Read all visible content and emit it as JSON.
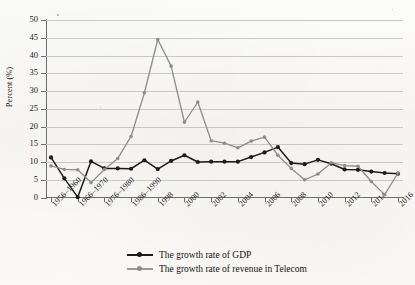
{
  "chart_data": {
    "type": "line",
    "title": "",
    "subtitle": "",
    "xlabel": "",
    "ylabel": "Percent (%)",
    "ylim": [
      0,
      50
    ],
    "ytick_step": 5,
    "yticks": [
      0,
      5,
      10,
      15,
      20,
      25,
      30,
      35,
      40,
      45,
      50
    ],
    "grid": true,
    "grid_axis": "y",
    "legend_position": "bottom-center",
    "x": [
      "1956–1960",
      "1961–1965",
      "1966–1970",
      "1971–1975",
      "1976–1980",
      "1981–1985",
      "1986–1990",
      "1991–1995",
      "1998",
      "1999",
      "2000",
      "2001",
      "2002",
      "2003",
      "2004",
      "2005",
      "2006",
      "2007",
      "2008",
      "2009",
      "2010",
      "2011",
      "2012",
      "2013",
      "2014",
      "2015",
      "2016"
    ],
    "xtick_labels": [
      "1956–1960",
      "1966–1970",
      "1976–1980",
      "1986–1990",
      "1998",
      "2000",
      "2002",
      "2004",
      "2006",
      "2008",
      "2010",
      "2012",
      "2014",
      "2016"
    ],
    "series": [
      {
        "name": "The growth rate of GDP",
        "color": "#1c1c1c",
        "marker": "circle",
        "values": [
          11.3,
          5.4,
          0.1,
          10.2,
          8.2,
          8.2,
          8.1,
          10.5,
          8.0,
          10.3,
          11.9,
          10.0,
          10.1,
          10.1,
          10.1,
          11.4,
          12.7,
          14.2,
          9.7,
          9.4,
          10.6,
          9.5,
          7.9,
          7.8,
          7.3,
          6.9,
          6.7
        ]
      },
      {
        "name": "The growth rate of revenue in Telecom",
        "color": "#8e8e8e",
        "marker": "circle",
        "values": [
          8.9,
          7.9,
          7.8,
          4.2,
          7.9,
          11.0,
          17.2,
          29.5,
          44.5,
          37.0,
          21.2,
          26.9,
          16.0,
          15.3,
          14.0,
          15.9,
          17.0,
          11.9,
          8.2,
          5.0,
          6.6,
          9.8,
          9.0,
          8.8,
          4.5,
          0.8,
          6.9
        ]
      }
    ]
  },
  "legend": {
    "items": [
      {
        "label": "The growth rate of GDP",
        "color": "#1c1c1c"
      },
      {
        "label": "The growth rate of revenue in Telecom",
        "color": "#8e8e8e"
      }
    ]
  },
  "axes": {
    "y_title": "Percent (%)",
    "y_ticks": [
      "50",
      "45",
      "40",
      "35",
      "30",
      "25",
      "20",
      "15",
      "10",
      "5",
      "0"
    ],
    "x_ticks": [
      "1956–1960",
      "1966–1970",
      "1976–1980",
      "1986–1990",
      "1998",
      "2000",
      "2002",
      "2004",
      "2006",
      "2008",
      "2010",
      "2012",
      "2014",
      "2016"
    ]
  }
}
